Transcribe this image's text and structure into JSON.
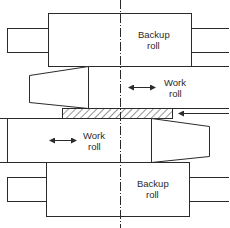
{
  "diagram": {
    "type": "rolling-mill-stand",
    "stroke_color": "#2a2a2a",
    "background": "#ffffff",
    "labels": {
      "upper_backup_roll": [
        "Backup",
        "roll"
      ],
      "upper_work_roll": [
        "Work",
        "roll"
      ],
      "lower_work_roll": [
        "Work",
        "roll"
      ],
      "lower_backup_roll": [
        "Backup",
        "roll"
      ]
    },
    "elements": [
      {
        "name": "upper-backup-roll",
        "label": "Backup roll"
      },
      {
        "name": "upper-work-roll",
        "label": "Work roll",
        "indicator": "double-headed horizontal arrow"
      },
      {
        "name": "workpiece-strip",
        "pattern": "hatched"
      },
      {
        "name": "lower-work-roll",
        "label": "Work roll",
        "indicator": "double-headed horizontal arrow"
      },
      {
        "name": "lower-backup-roll",
        "label": "Backup roll"
      },
      {
        "name": "centerline",
        "style": "dash-dot vertical"
      },
      {
        "name": "feed-arrow",
        "direction": "left"
      }
    ]
  }
}
